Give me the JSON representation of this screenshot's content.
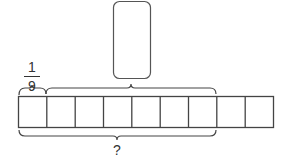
{
  "diagram": {
    "type": "bar-model",
    "total_cells": 9,
    "unit_fraction": {
      "numerator": "1",
      "denominator": "9"
    },
    "answer_box": {
      "value": "",
      "spans_cells": [
        2,
        7
      ]
    },
    "bottom_label": "?",
    "bottom_brace_spans_cells": [
      1,
      7
    ],
    "colors": {
      "stroke": "#333333",
      "background": "#ffffff"
    }
  }
}
